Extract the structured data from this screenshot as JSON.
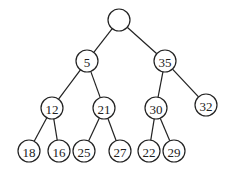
{
  "tree": {
    "nodes": [
      {
        "id": "root",
        "label": "",
        "x": 119,
        "y": 20
      },
      {
        "id": "n5",
        "label": "5",
        "x": 87,
        "y": 61
      },
      {
        "id": "n35",
        "label": "35",
        "x": 165,
        "y": 61
      },
      {
        "id": "n12",
        "label": "12",
        "x": 52,
        "y": 108
      },
      {
        "id": "n21",
        "label": "21",
        "x": 104,
        "y": 108
      },
      {
        "id": "n30",
        "label": "30",
        "x": 156,
        "y": 108
      },
      {
        "id": "n32",
        "label": "32",
        "x": 206,
        "y": 105
      },
      {
        "id": "n18",
        "label": "18",
        "x": 29,
        "y": 151
      },
      {
        "id": "n16",
        "label": "16",
        "x": 59,
        "y": 151
      },
      {
        "id": "n25",
        "label": "25",
        "x": 84,
        "y": 151
      },
      {
        "id": "n27",
        "label": "27",
        "x": 120,
        "y": 151
      },
      {
        "id": "n22",
        "label": "22",
        "x": 149,
        "y": 151
      },
      {
        "id": "n29",
        "label": "29",
        "x": 174,
        "y": 151
      }
    ],
    "edges": [
      [
        "root",
        "n5"
      ],
      [
        "root",
        "n35"
      ],
      [
        "n5",
        "n12"
      ],
      [
        "n5",
        "n21"
      ],
      [
        "n35",
        "n30"
      ],
      [
        "n35",
        "n32"
      ],
      [
        "n12",
        "n18"
      ],
      [
        "n12",
        "n16"
      ],
      [
        "n21",
        "n25"
      ],
      [
        "n21",
        "n27"
      ],
      [
        "n30",
        "n22"
      ],
      [
        "n30",
        "n29"
      ]
    ],
    "radius": 11
  }
}
